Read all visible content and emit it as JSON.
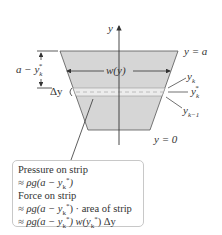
{
  "diagram": {
    "axis": {
      "label": "y"
    },
    "colors": {
      "fill": "#d6d6d6",
      "strip": "#ebebeb",
      "stroke": "#333333",
      "box_border": "#c8c8c8"
    },
    "left_labels": {
      "depth": "a − y",
      "depth_sub": "k",
      "depth_sup": "*",
      "delta": "Δy"
    },
    "width_label": "w(y)",
    "right_labels": {
      "top": "y = a",
      "yk": "y",
      "yk_sub": "k",
      "ykstar": "y",
      "ykstar_sub": "k",
      "ykstar_sup": "*",
      "ykm1": "y",
      "ykm1_sub": "k−1",
      "bottom": "y = 0"
    },
    "callout": {
      "line1": "Pressure on strip",
      "line2_pre": "≈ ρg(a − y",
      "line2_sub": "k",
      "line2_sup": "*",
      "line2_post": ")",
      "line3": "Force on strip",
      "line4_pre": "≈ ρg(a − y",
      "line4_sub": "k",
      "line4_sup": "*",
      "line4_post": ") · area of strip",
      "line5_pre": "≈ ρg(a − y",
      "line5_sub": "k",
      "line5_sup": "*",
      "line5_mid": ") w(y",
      "line5_sub2": "k",
      "line5_sup2": "*",
      "line5_post": ") Δy"
    }
  }
}
